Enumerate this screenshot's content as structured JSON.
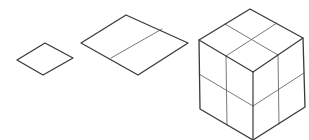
{
  "diagram": {
    "type": "isometric-shapes",
    "colors": {
      "background": "#ffffff",
      "outline": "#3a3a3a",
      "inner": "#6a6a6a"
    },
    "shapes": [
      {
        "id": "small-rhombus",
        "label": "unit square",
        "outline": "45,43 73,58 43,75 17,60",
        "inner_lines": []
      },
      {
        "id": "medium-rhombus",
        "label": "2x1 rectangle",
        "outline": "126,15 188,43 138,75 81,43",
        "inner_lines": [
          {
            "x1": 162,
            "y1": 29,
            "x2": 111,
            "y2": 58
          }
        ]
      },
      {
        "id": "cube",
        "label": "2x2x2 cube",
        "outline": "250,9 303,38 305,107 253,140 200,109 199,40",
        "edges": [
          {
            "x1": 199,
            "y1": 40,
            "x2": 253,
            "y2": 72
          },
          {
            "x1": 303,
            "y1": 38,
            "x2": 253,
            "y2": 72
          },
          {
            "x1": 253,
            "y1": 72,
            "x2": 253,
            "y2": 140
          }
        ],
        "inner_lines": [
          {
            "x1": 225,
            "y1": 24,
            "x2": 278,
            "y2": 55
          },
          {
            "x1": 277,
            "y1": 23,
            "x2": 226,
            "y2": 56
          },
          {
            "x1": 226,
            "y1": 56,
            "x2": 227,
            "y2": 125
          },
          {
            "x1": 278,
            "y1": 55,
            "x2": 279,
            "y2": 124
          },
          {
            "x1": 199,
            "y1": 74,
            "x2": 253,
            "y2": 106
          },
          {
            "x1": 253,
            "y1": 106,
            "x2": 304,
            "y2": 73
          }
        ]
      }
    ]
  }
}
